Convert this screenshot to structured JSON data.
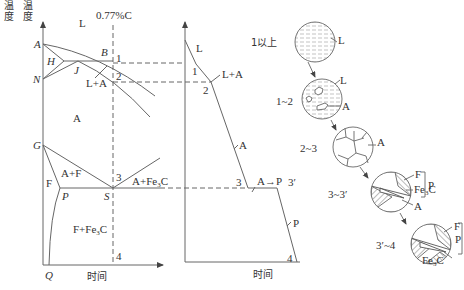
{
  "phase_diagram": {
    "composition_label": "0.77%C",
    "y_axis_label": "温度",
    "x_axis_label": "时间",
    "points": [
      "A",
      "B",
      "H",
      "J",
      "N",
      "G",
      "P",
      "S",
      "Q"
    ],
    "regions": {
      "liquid": "L",
      "liquid_austenite": "L+A",
      "austenite": "A",
      "austenite_ferrite": "A+F",
      "ferrite": "F",
      "austenite_cementite_prefix": "A+Fe",
      "ferrite_cementite_prefix": "F+Fe",
      "cementite_sub": "3",
      "cementite_suffix": "C"
    },
    "markers": [
      "1",
      "2",
      "3",
      "4"
    ]
  },
  "cooling_curve": {
    "y_axis_label": "温度",
    "x_axis_label": "时间",
    "markers": [
      "1",
      "2",
      "3",
      "3′",
      "4"
    ],
    "labels": {
      "liquid": "L",
      "liquid_austenite": "L+A",
      "austenite": "A",
      "transformation": "A→P",
      "pearlite": "P"
    }
  },
  "microstructures": {
    "stages": [
      {
        "range": "1以上",
        "phases": [
          "L"
        ]
      },
      {
        "range": "1~2",
        "phases": [
          "L",
          "A"
        ]
      },
      {
        "range": "2~3",
        "phases": [
          "A"
        ]
      },
      {
        "range": "3~3′",
        "phases": [
          "F",
          "Fe3C",
          "A"
        ],
        "group_label": "P"
      },
      {
        "range": "3′~4",
        "phases": [
          "F",
          "Fe3C"
        ],
        "group_label": "P"
      }
    ],
    "fe_prefix": "Fe",
    "fe_sub": "3",
    "fe_suffix": "C"
  }
}
